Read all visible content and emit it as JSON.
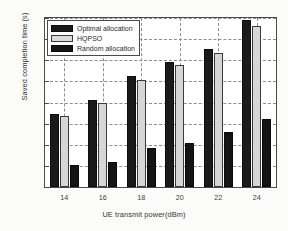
{
  "chart_data": {
    "type": "bar",
    "title": "",
    "xlabel": "UE transmit power(dBm)",
    "ylabel": "Saved completion time (s)",
    "categories": [
      "14",
      "16",
      "18",
      "20",
      "22",
      "24"
    ],
    "series": [
      {
        "name": "Optimal allocation",
        "color": "#1a1a1a",
        "values": [
          0.172,
          0.205,
          0.263,
          0.295,
          0.327,
          0.395
        ]
      },
      {
        "name": "HQPSO",
        "color": "#d6d6d6",
        "values": [
          0.167,
          0.198,
          0.254,
          0.289,
          0.318,
          0.381
        ]
      },
      {
        "name": "Random allocation",
        "color": "#141414",
        "values": [
          0.053,
          0.06,
          0.093,
          0.105,
          0.13,
          0.16
        ]
      }
    ],
    "ylim": [
      0,
      0.4
    ],
    "yticks": [
      "0",
      "0.05",
      "0.1",
      "0.15",
      "0.2",
      "0.25",
      "0.3",
      "0.35",
      "0.4"
    ],
    "ytick_values": [
      0,
      0.05,
      0.1,
      0.15,
      0.2,
      0.25,
      0.3,
      0.35,
      0.4
    ],
    "grid": true,
    "grid_style": "dashed",
    "legend_position": "top-left"
  },
  "legend": {
    "items": [
      {
        "label": "Optimal allocation"
      },
      {
        "label": "HQPSO"
      },
      {
        "label": "Random allocation"
      }
    ]
  }
}
